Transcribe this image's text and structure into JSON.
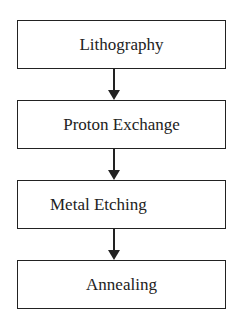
{
  "flowchart": {
    "steps": [
      {
        "label": "Lithography"
      },
      {
        "label": "Proton Exchange"
      },
      {
        "label": "Metal Etching"
      },
      {
        "label": "Annealing"
      }
    ]
  }
}
